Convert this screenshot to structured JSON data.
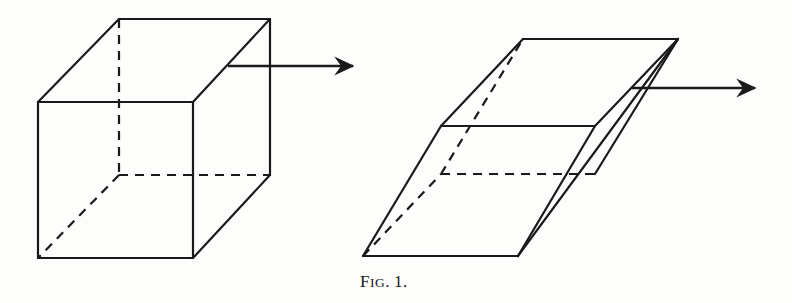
{
  "figure": {
    "caption_lead": "F",
    "caption_rest": "IG",
    "caption_dot": ".",
    "caption_number": "1.",
    "caption_full": "Fig. 1.",
    "background_color": "#fdfdfc",
    "ink_color": "#1a1a1a",
    "stroke_width": 2.2,
    "dash_pattern": "9 7"
  },
  "left_shape": {
    "name": "cube",
    "label": "undeformed cube",
    "vertices": {
      "front_top_left": [
        38,
        102
      ],
      "front_top_right": [
        193,
        102
      ],
      "front_bottom_left": [
        38,
        258
      ],
      "front_bottom_right": [
        193,
        258
      ],
      "back_top_left": [
        119,
        19
      ],
      "back_top_right": [
        270,
        19
      ],
      "back_bottom_left": [
        119,
        175
      ],
      "back_bottom_right": [
        270,
        175
      ]
    },
    "solid_edges": [
      [
        [
          38,
          102
        ],
        [
          193,
          102
        ]
      ],
      [
        [
          193,
          102
        ],
        [
          193,
          258
        ]
      ],
      [
        [
          193,
          258
        ],
        [
          38,
          258
        ]
      ],
      [
        [
          38,
          258
        ],
        [
          38,
          102
        ]
      ],
      [
        [
          38,
          102
        ],
        [
          119,
          19
        ]
      ],
      [
        [
          119,
          19
        ],
        [
          270,
          19
        ]
      ],
      [
        [
          270,
          19
        ],
        [
          270,
          175
        ]
      ],
      [
        [
          270,
          175
        ],
        [
          193,
          258
        ]
      ],
      [
        [
          193,
          102
        ],
        [
          270,
          19
        ]
      ]
    ],
    "dashed_edges": [
      [
        [
          119,
          19
        ],
        [
          119,
          175
        ]
      ],
      [
        [
          119,
          175
        ],
        [
          270,
          175
        ]
      ],
      [
        [
          119,
          175
        ],
        [
          38,
          258
        ]
      ]
    ],
    "arrow": {
      "name": "shear-force-arrow",
      "start": [
        228,
        66
      ],
      "end": [
        353,
        66
      ],
      "direction": "right"
    }
  },
  "right_shape": {
    "name": "sheared-parallelepiped",
    "label": "sheared parallelepiped",
    "vertices": {
      "bottom_front_left": [
        363,
        256
      ],
      "bottom_front_right": [
        518,
        256
      ],
      "bottom_back_left": [
        441,
        174
      ],
      "bottom_back_right": [
        595,
        174
      ],
      "top_front_left": [
        441,
        126
      ],
      "top_front_right": [
        595,
        126
      ],
      "top_back_left": [
        523,
        39
      ],
      "top_back_right": [
        678,
        39
      ]
    },
    "solid_edges": [
      [
        [
          363,
          256
        ],
        [
          518,
          256
        ]
      ],
      [
        [
          363,
          256
        ],
        [
          441,
          126
        ]
      ],
      [
        [
          441,
          126
        ],
        [
          595,
          126
        ]
      ],
      [
        [
          441,
          126
        ],
        [
          523,
          39
        ]
      ],
      [
        [
          523,
          39
        ],
        [
          678,
          39
        ]
      ],
      [
        [
          678,
          39
        ],
        [
          595,
          126
        ]
      ],
      [
        [
          678,
          39
        ],
        [
          518,
          256
        ]
      ],
      [
        [
          595,
          126
        ],
        [
          518,
          256
        ]
      ],
      [
        [
          595,
          174
        ],
        [
          678,
          39
        ]
      ]
    ],
    "dashed_edges": [
      [
        [
          441,
          174
        ],
        [
          595,
          174
        ]
      ],
      [
        [
          441,
          174
        ],
        [
          523,
          39
        ]
      ],
      [
        [
          363,
          256
        ],
        [
          441,
          174
        ]
      ]
    ],
    "arrow": {
      "name": "shear-force-arrow",
      "start": [
        632,
        88
      ],
      "end": [
        755,
        88
      ],
      "direction": "right"
    }
  }
}
